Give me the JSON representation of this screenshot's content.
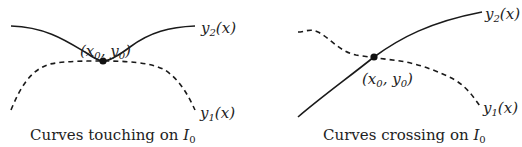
{
  "panels": [
    {
      "name": "touching",
      "caption_text": "Curves touching on ",
      "caption_interval": "I",
      "caption_sub": "0",
      "curve_y2": {
        "label": "y",
        "sub": "2",
        "arg": "(x)",
        "style": "solid"
      },
      "curve_y1": {
        "label": "y",
        "sub": "1",
        "arg": "(x)",
        "style": "dashed"
      },
      "point": {
        "open": "(x",
        "sub1": "0",
        "mid": ", y",
        "sub2": "0",
        "close": ")"
      }
    },
    {
      "name": "crossing",
      "caption_text": "Curves crossing on ",
      "caption_interval": "I",
      "caption_sub": "0",
      "curve_y2": {
        "label": "y",
        "sub": "2",
        "arg": "(x)",
        "style": "solid"
      },
      "curve_y1": {
        "label": "y",
        "sub": "1",
        "arg": "(x)",
        "style": "dashed"
      },
      "point": {
        "open": "(x",
        "sub1": "0",
        "mid": ", y",
        "sub2": "0",
        "close": ")"
      }
    }
  ],
  "colors": {
    "ink": "#1a1a1a",
    "background": "#ffffff"
  }
}
